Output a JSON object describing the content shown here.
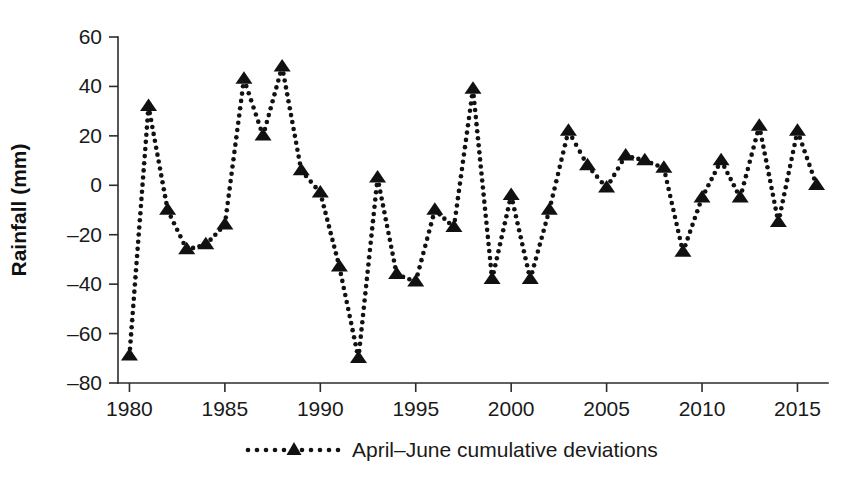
{
  "figure": {
    "background_color": "#ffffff",
    "ink_color": "#111111"
  },
  "axes": {
    "y_title": "Rainfall (mm)",
    "x_title": "",
    "y_ticks": [
      "60",
      "40",
      "20",
      "0",
      "-20",
      "-40",
      "-60",
      "-80"
    ],
    "x_ticks": [
      "1980",
      "1985",
      "1990",
      "1995",
      "2000",
      "2005",
      "2010",
      "2015"
    ]
  },
  "legend": {
    "marker": "triangle-up-icon",
    "label": "April–June cumulative deviations"
  },
  "chart_data": {
    "type": "line",
    "title": "",
    "xlabel": "",
    "ylabel": "Rainfall (mm)",
    "xlim": [
      1979.4,
      1916.0
    ],
    "x_range": [
      1979.4,
      2016.6
    ],
    "ylim": [
      -80,
      60
    ],
    "y_tick_step": 20,
    "x_tick_step": 5,
    "grid": false,
    "legend_position": "bottom-center",
    "line_style": "dotted",
    "marker": "triangle-up",
    "series": [
      {
        "name": "April–June cumulative deviations",
        "x": [
          1980,
          1981,
          1982,
          1983,
          1984,
          1985,
          1986,
          1987,
          1988,
          1989,
          1990,
          1991,
          1992,
          1993,
          1994,
          1995,
          1996,
          1997,
          1998,
          1999,
          2000,
          2001,
          2002,
          2003,
          2004,
          2005,
          2006,
          2007,
          2008,
          2009,
          2010,
          2011,
          2012,
          2013,
          2014,
          2015,
          2016
        ],
        "values": [
          -69,
          32,
          -10,
          -26,
          -24,
          -16,
          43,
          20,
          48,
          6,
          -3,
          -33,
          -70,
          3,
          -36,
          -39,
          -10,
          -17,
          39,
          -38,
          -4,
          -38,
          -10,
          22,
          8,
          -1,
          12,
          10,
          7,
          -27,
          -5,
          10,
          -5,
          24,
          -15,
          22,
          0
        ]
      }
    ]
  }
}
